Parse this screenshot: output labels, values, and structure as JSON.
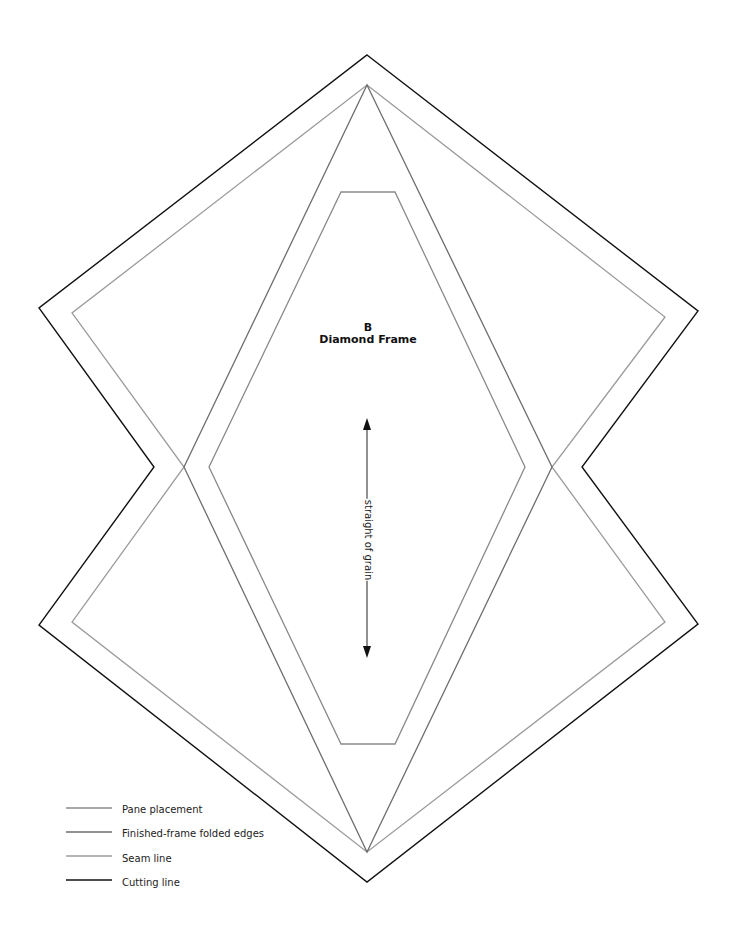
{
  "template": {
    "piece_letter": "B",
    "piece_name": "Diamond Frame",
    "grain_label": "straight of grain"
  },
  "legend": {
    "items": [
      {
        "label": "Pane placement",
        "color": "#8a8a8a"
      },
      {
        "label": "Finished-frame folded edges",
        "color": "#6e6e6e"
      },
      {
        "label": "Seam line",
        "color": "#9c9c9c"
      },
      {
        "label": "Cutting line",
        "color": "#111111"
      }
    ]
  },
  "shapes": {
    "cutting_line": "367,55 698,311 582,467 698,624 367,882 39,625 154,467 39,308",
    "seam_line": "367,85 665,317 552,467 665,622 367,852 72,622 184,467 72,313",
    "folded_edges": "367,85 552,467 367,852 184,467",
    "pane_placement": "341,192 395,192 525,467 395,744 341,744 209,467"
  }
}
